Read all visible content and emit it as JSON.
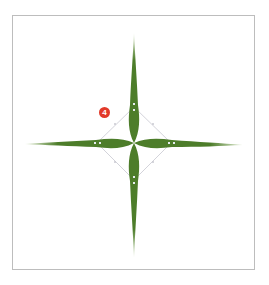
{
  "figure": {
    "step_number": "4",
    "colors": {
      "petal_fill": "#4d7d2a",
      "petal_tip": "#d7e6c4",
      "guide_path": "#c8c8d0",
      "anchor_point": "#e6ecef",
      "badge": "#e23a2a",
      "frame_border": "#bdbdbd"
    },
    "star": {
      "center": [
        134,
        143
      ],
      "arm_length_vertical_up": 110,
      "arm_length_vertical_down": 115,
      "arm_length_horizontal_left": 109,
      "arm_length_horizontal_right": 109
    },
    "guide_diamond": {
      "points": [
        [
          134,
          107
        ],
        [
          171,
          143
        ],
        [
          134,
          180
        ],
        [
          97,
          143
        ]
      ]
    }
  }
}
